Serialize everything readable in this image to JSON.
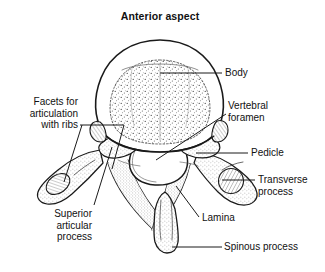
{
  "figure": {
    "view_title_line1": "Anterior",
    "view_title_line2": "aspect",
    "ink_color": "#1a1a1a",
    "background_color": "#ffffff"
  },
  "labels": {
    "body": "Body",
    "vertebral_foramen_l1": "Vertebral",
    "vertebral_foramen_l2": "foramen",
    "pedicle": "Pedicle",
    "transverse_process_l1": "Transverse",
    "transverse_process_l2": "process",
    "lamina": "Lamina",
    "spinous_process": "Spinous process",
    "facets_l1": "Facets for",
    "facets_l2": "articulation",
    "facets_l3": "with ribs",
    "superior_articular_l1": "Superior",
    "superior_articular_l2": "articular",
    "superior_articular_l3": "process"
  }
}
